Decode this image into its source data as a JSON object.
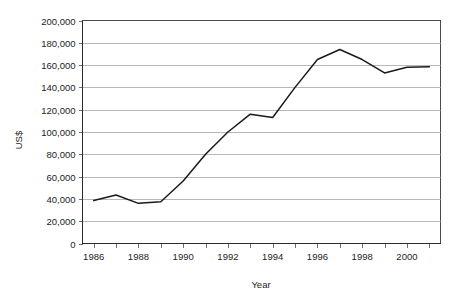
{
  "chart_data": {
    "type": "line",
    "title": "",
    "xlabel": "Year",
    "ylabel": "US$",
    "xlim": [
      1985.5,
      2001.5
    ],
    "ylim": [
      0,
      200000
    ],
    "grid": true,
    "legend": false,
    "x": [
      1986,
      1987,
      1988,
      1989,
      1990,
      1991,
      1992,
      1993,
      1994,
      1995,
      1996,
      1997,
      1998,
      1999,
      2000,
      2001
    ],
    "series": [
      {
        "name": "US$",
        "values": [
          38500,
          43500,
          36000,
          37500,
          56000,
          80000,
          100000,
          116000,
          113000,
          140000,
          165000,
          174000,
          165000,
          153000,
          158000,
          158500
        ]
      }
    ],
    "x_tick_labels": [
      "1986",
      "1988",
      "1990",
      "1992",
      "1994",
      "1996",
      "1998",
      "2000"
    ],
    "x_tick_values": [
      1986,
      1988,
      1990,
      1992,
      1994,
      1996,
      1998,
      2000
    ],
    "y_tick_labels": [
      "0",
      "20,000",
      "40,000",
      "60,000",
      "80,000",
      "100,000",
      "120,000",
      "140,000",
      "160,000",
      "180,000",
      "200,000"
    ],
    "y_tick_values": [
      0,
      20000,
      40000,
      60000,
      80000,
      100000,
      120000,
      140000,
      160000,
      180000,
      200000
    ],
    "colors": {
      "line": "#1a1a1a",
      "grid": "#9a9a9a",
      "axis": "#2b2b2b",
      "background": "#ffffff"
    }
  }
}
